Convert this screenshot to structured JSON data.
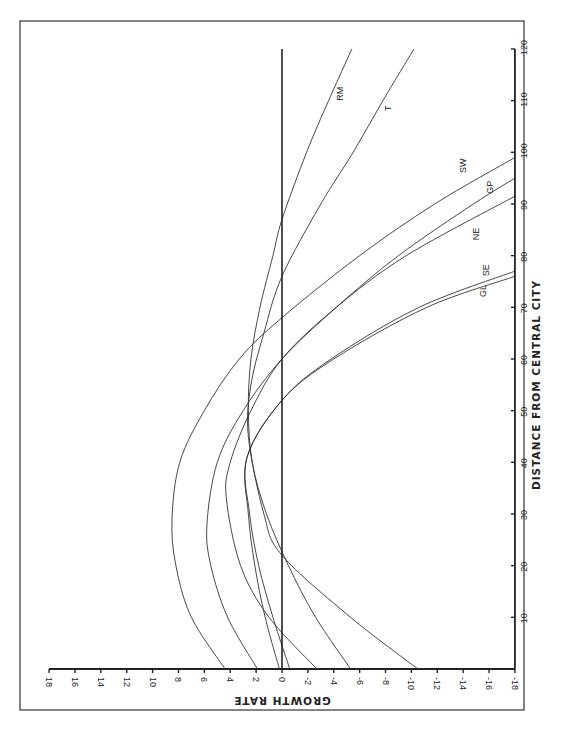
{
  "chart_data": {
    "type": "line",
    "orientation": "rotated 90 degrees clockwise (growth rate on horizontal axis reversed, distance on vertical axis)",
    "title": "",
    "xlabel": "DISTANCE FROM CENTRAL CITY",
    "ylabel": "GROWTH RATE",
    "xlim": [
      0,
      120
    ],
    "ylim": [
      -18,
      18
    ],
    "x_ticks": [
      10,
      20,
      30,
      40,
      50,
      60,
      70,
      80,
      90,
      100,
      110,
      120
    ],
    "y_ticks": [
      18,
      16,
      14,
      12,
      10,
      8,
      6,
      4,
      2,
      0,
      -2,
      -4,
      -6,
      -8,
      -10,
      -12,
      -14,
      -16,
      -18
    ],
    "x_tick_labels": [
      "10",
      "20",
      "30",
      "40",
      "50",
      "60",
      "70",
      "80",
      "90",
      "100",
      "110",
      "120"
    ],
    "y_tick_labels": [
      "18",
      "16",
      "14",
      "12",
      "10",
      "8",
      "6",
      "4",
      "2",
      "0",
      "-2",
      "-4",
      "-6",
      "-8",
      "-10",
      "-12",
      "-14",
      "-16",
      "-18"
    ],
    "reference_line": {
      "y": 0
    },
    "grid": false,
    "series": [
      {
        "name": "SW",
        "x": [
          0,
          10,
          20,
          29,
          40,
          50,
          60,
          68,
          80,
          90,
          99
        ],
        "values": [
          4.4,
          7.0,
          8.2,
          8.5,
          7.9,
          6.0,
          3.3,
          0.0,
          -6.0,
          -11.8,
          -18.0
        ]
      },
      {
        "name": "GP",
        "x": [
          0,
          10,
          20,
          28,
          40,
          50,
          60,
          70,
          80,
          90,
          95
        ],
        "values": [
          1.9,
          4.2,
          5.5,
          5.8,
          5.0,
          3.0,
          0.0,
          -4.2,
          -9.0,
          -14.8,
          -18.0
        ]
      },
      {
        "name": "NE",
        "x": [
          0,
          10,
          20,
          33,
          40,
          50,
          60,
          70,
          80,
          91.5
        ],
        "values": [
          -2.7,
          1.0,
          3.2,
          4.3,
          4.0,
          2.4,
          0.0,
          -4.2,
          -9.6,
          -18.0
        ]
      },
      {
        "name": "SE",
        "x": [
          0,
          10,
          20,
          30,
          41,
          52,
          60,
          70,
          77
        ],
        "values": [
          0.2,
          1.3,
          2.1,
          2.6,
          2.7,
          0.0,
          -3.8,
          -10.6,
          -18.0
        ]
      },
      {
        "name": "GL",
        "x": [
          0,
          10,
          20,
          30,
          41,
          52,
          60,
          70,
          76
        ],
        "values": [
          -0.6,
          0.7,
          1.8,
          2.5,
          2.7,
          0.0,
          -4.0,
          -11.2,
          -18.0
        ]
      },
      {
        "name": "RM",
        "x": [
          0,
          10,
          20,
          30,
          40,
          50,
          60,
          70,
          80,
          87,
          100,
          110,
          120
        ],
        "values": [
          -5.3,
          -2.6,
          -0.5,
          1.2,
          2.3,
          2.6,
          2.4,
          1.7,
          0.7,
          0.0,
          -1.9,
          -3.6,
          -5.4
        ]
      },
      {
        "name": "T",
        "x": [
          0,
          10,
          22,
          30,
          45,
          55,
          65,
          76,
          90,
          100,
          110,
          120
        ],
        "values": [
          -10.5,
          -5.3,
          0.0,
          1.4,
          2.6,
          2.4,
          1.4,
          0.0,
          -3.0,
          -5.5,
          -7.8,
          -10.2
        ]
      }
    ],
    "series_labels": [
      {
        "name": "RM",
        "distance": 110,
        "growth": -4.7
      },
      {
        "name": "T",
        "distance": 108,
        "growth": -8.4
      },
      {
        "name": "SW",
        "distance": 96,
        "growth": -14.2
      },
      {
        "name": "GP",
        "distance": 92,
        "growth": -16.3
      },
      {
        "name": "NE",
        "distance": 83,
        "growth": -15.2
      },
      {
        "name": "SE",
        "distance": 76,
        "growth": -16.0
      },
      {
        "name": "GL",
        "distance": 72,
        "growth": -15.8
      }
    ]
  },
  "labels": {
    "x_axis_title": "DISTANCE FROM CENTRAL CITY",
    "y_axis_title": "GROWTH RATE"
  }
}
